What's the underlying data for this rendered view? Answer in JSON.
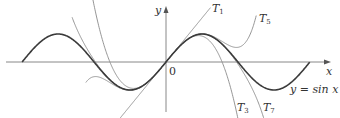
{
  "diagram": {
    "origin_px": [
      166,
      62
    ],
    "scale_px_per_unit": [
      22.9,
      28
    ],
    "x_range": [
      -7.0,
      7.2
    ],
    "axis_labels": {
      "x": "x",
      "y": "y",
      "origin": "0"
    },
    "colors": {
      "sin": "#3a3a3a",
      "taylor": "#8a8a8a",
      "axis": "#7a7a7a",
      "text": "#333333"
    },
    "curves": [
      {
        "name": "sin",
        "label": "y = sin x",
        "domain": [
          -6.2832,
          6.2832
        ]
      },
      {
        "name": "T1",
        "label": "T",
        "sub": "1",
        "order": 1,
        "domain": [
          -2.6,
          1.95
        ]
      },
      {
        "name": "T3",
        "label": "T",
        "sub": "3",
        "order": 3,
        "domain": [
          -3.2,
          3.3
        ]
      },
      {
        "name": "T5",
        "label": "T",
        "sub": "5",
        "order": 5,
        "domain": [
          -3.5,
          3.95
        ]
      },
      {
        "name": "T7",
        "label": "T",
        "sub": "7",
        "order": 7,
        "domain": [
          -4.1,
          4.3
        ]
      }
    ],
    "labels": {
      "T1": {
        "text": "T",
        "sub": "1",
        "pos": [
          212,
          3
        ]
      },
      "T5": {
        "text": "T",
        "sub": "5",
        "pos": [
          258,
          13
        ]
      },
      "T3": {
        "text": "T",
        "sub": "3",
        "pos": [
          237,
          102
        ]
      },
      "T7": {
        "text": "T",
        "sub": "7",
        "pos": [
          262,
          102
        ]
      },
      "sin": {
        "text": "y = sin x",
        "pos": [
          290,
          84
        ]
      },
      "x": {
        "text": "x",
        "pos": [
          327,
          66
        ]
      },
      "y": {
        "text": "y",
        "pos": [
          156,
          5
        ]
      },
      "origin": {
        "text": "0",
        "pos": [
          169,
          66
        ]
      }
    }
  }
}
